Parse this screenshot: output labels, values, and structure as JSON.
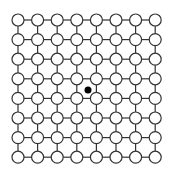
{
  "diagram": {
    "type": "lattice",
    "rows": 8,
    "cols": 8,
    "origin_x": 18,
    "origin_y": 20,
    "spacing": 19.6,
    "node_radius": 6,
    "node_fill": "#ffffff",
    "stroke": "#333333",
    "center_dot": {
      "x": 88,
      "y": 90,
      "r": 3.5,
      "color": "#000000"
    }
  }
}
